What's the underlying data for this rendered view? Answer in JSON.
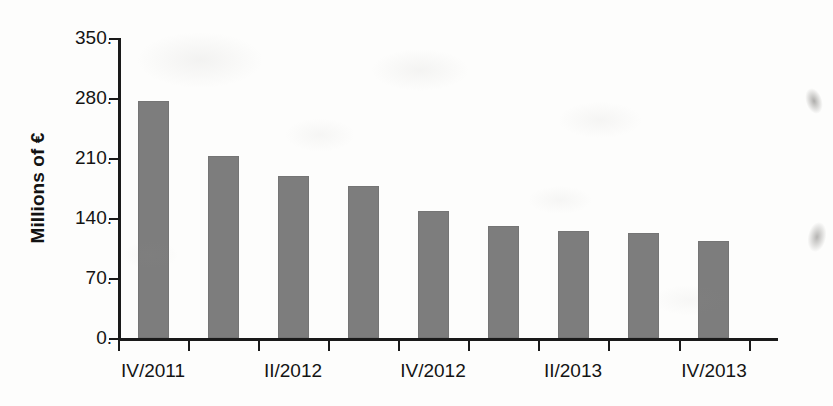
{
  "chart_data": {
    "type": "bar",
    "title": "",
    "subtitle": "",
    "xlabel": "",
    "ylabel": "Millions of €",
    "ylim": [
      0,
      350
    ],
    "yticks": [
      0,
      70,
      140,
      210,
      280,
      350
    ],
    "ytick_labels": [
      "0.",
      "70.",
      "140.",
      "210.",
      "280.",
      "350."
    ],
    "grid": false,
    "legend": false,
    "legend_position": "none",
    "bar_color": "#7d7d7d",
    "axis_color": "#1a1a1a",
    "categories": [
      "IV/2011",
      "I/2012",
      "II/2012",
      "III/2012",
      "IV/2012",
      "I/2013",
      "II/2013",
      "III/2013",
      "IV/2013"
    ],
    "xtick_labels": [
      "IV/2011",
      "",
      "II/2012",
      "",
      "IV/2012",
      "",
      "II/2013",
      "",
      "IV/2013"
    ],
    "visible_xtick_labels": [
      "IV/2011",
      "II/2012",
      "IV/2012",
      "II/2013",
      "IV/2013"
    ],
    "values": [
      276,
      212,
      189,
      177,
      148,
      131,
      125,
      123,
      113
    ]
  }
}
